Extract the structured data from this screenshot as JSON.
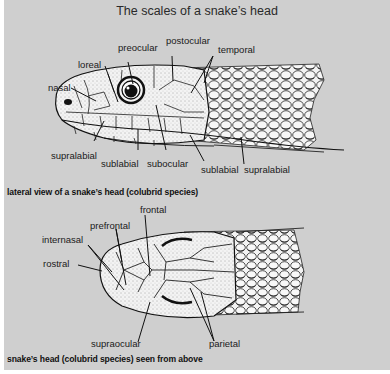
{
  "title": "The scales of a snake’s head",
  "lateral": {
    "caption": "lateral view of a snake’s head (colubrid species)",
    "labels": {
      "nasal": "nasal",
      "loreal": "loreal",
      "preocular": "preocular",
      "postocular": "postocular",
      "temporal": "temporal",
      "supralabial_left": "supralabial",
      "sublabial_left": "sublabial",
      "subocular": "subocular",
      "sublabial_right": "sublabial",
      "supralabial_right": "supralabial"
    }
  },
  "dorsal": {
    "caption": "snake’s head (colubrid species) seen from above",
    "labels": {
      "internasal": "internasal",
      "prefrontal": "prefrontal",
      "frontal": "frontal",
      "rostral": "rostral",
      "supraocular": "supraocular",
      "parietal": "parietal"
    }
  },
  "colors": {
    "background": "#cfcfcf",
    "ink": "#111111",
    "scale_fill": "#f4f4f4"
  }
}
